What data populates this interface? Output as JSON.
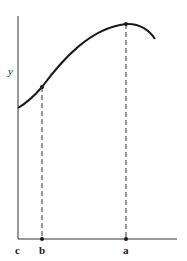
{
  "diagram": {
    "y_axis_label": "y",
    "x_axis_labels": {
      "c": "c",
      "b": "b",
      "a": "a"
    },
    "curve": {
      "description": "smooth curve rising from y-axis to a maximum above point a, then falling",
      "marked_points": [
        "b",
        "a"
      ]
    },
    "colors": {
      "line": "#1a1a1a",
      "background": "#ffffff"
    }
  }
}
